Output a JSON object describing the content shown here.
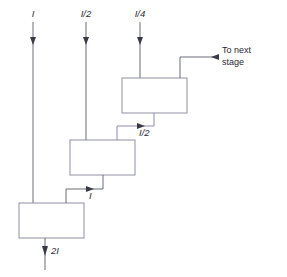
{
  "diagram": {
    "colors": {
      "wire": "#6b6b78",
      "wire_accent": "#8d8ab4",
      "box_stroke": "#8f8fa6",
      "box_fill": "#ffffff",
      "arrow": "#3a3a46",
      "text": "#2b2b33",
      "background": "#ffffff"
    },
    "inputs": [
      {
        "id": "input-1",
        "label": "I",
        "x": 33,
        "arrow_y": 41
      },
      {
        "id": "input-2",
        "label": "I/2",
        "x": 86,
        "arrow_y": 41
      },
      {
        "id": "input-3",
        "label": "I/4",
        "x": 140,
        "arrow_y": 41
      }
    ],
    "boxes": [
      {
        "id": "stage-box-top",
        "x": 122,
        "y": 78,
        "w": 65,
        "h": 35
      },
      {
        "id": "stage-box-middle",
        "x": 70,
        "y": 140,
        "w": 65,
        "h": 35
      },
      {
        "id": "stage-box-bottom",
        "x": 19,
        "y": 203,
        "w": 65,
        "h": 35
      }
    ],
    "interstage_labels": [
      {
        "id": "interstage-label-upper",
        "label": "I/2",
        "x": 139,
        "y": 133
      },
      {
        "id": "interstage-label-lower",
        "label": "I",
        "x": 89,
        "y": 196
      }
    ],
    "output": {
      "id": "output-label",
      "label": "2I",
      "x": 49,
      "y": 250
    },
    "next_stage": {
      "id": "next-stage-label",
      "line1": "To next",
      "line2": "stage",
      "x": 222,
      "y1": 50,
      "y2": 62
    }
  }
}
